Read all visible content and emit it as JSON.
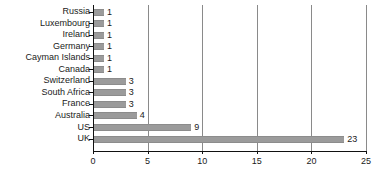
{
  "chart_data": {
    "type": "bar",
    "orientation": "horizontal",
    "title": "",
    "xlabel": "",
    "ylabel": "",
    "xlim": [
      0,
      25
    ],
    "xticks": [
      0,
      5,
      10,
      15,
      20,
      25
    ],
    "grid": "vertical",
    "legend": "none",
    "bar_color": "#9b9b9b",
    "axis_color": "#111111",
    "gridline_color": "#8a8a8a",
    "background": "#ffffff",
    "show_value_labels": true,
    "categories": [
      "Russia",
      "Luxembourg",
      "Ireland",
      "Germany",
      "Cayman Islands",
      "Canada",
      "Switzerland",
      "South Africa",
      "France",
      "Australia",
      "US",
      "UK"
    ],
    "values": [
      1,
      1,
      1,
      1,
      1,
      1,
      3,
      3,
      3,
      4,
      9,
      23
    ]
  }
}
